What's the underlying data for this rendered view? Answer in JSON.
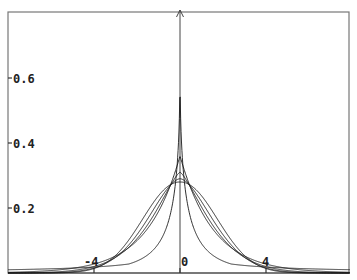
{
  "chart_data": {
    "type": "line",
    "title": "",
    "xlabel": "",
    "ylabel": "",
    "xlim": [
      -8.0,
      7.9
    ],
    "ylim": [
      0,
      0.8
    ],
    "grid": false,
    "legend": null,
    "y_ticks": [
      {
        "value": 0.2,
        "label": "0.2"
      },
      {
        "value": 0.4,
        "label": "0.4"
      },
      {
        "value": 0.6,
        "label": "0.6"
      }
    ],
    "x_ticks": [
      {
        "value": -4,
        "label": "-4"
      },
      {
        "value": 0,
        "label": "0"
      },
      {
        "value": 4,
        "label": "4"
      }
    ],
    "series": [
      {
        "name": "curve-1 (most peaked)",
        "peak": 0.63,
        "shape_p": 0.55,
        "scale": 0.3
      },
      {
        "name": "curve-2",
        "peak": 0.36,
        "shape_p": 1.0,
        "scale": 1.4
      },
      {
        "name": "curve-3",
        "peak": 0.31,
        "shape_p": 1.35,
        "scale": 1.75
      },
      {
        "name": "curve-4",
        "peak": 0.29,
        "shape_p": 1.7,
        "scale": 2.0
      },
      {
        "name": "curve-5 (broadest)",
        "peak": 0.28,
        "shape_p": 2.1,
        "scale": 2.25
      }
    ],
    "x": [
      -8,
      -6,
      -4,
      -3,
      -2,
      -1.5,
      -1,
      -0.5,
      0,
      0.5,
      1,
      1.5,
      2,
      3,
      4,
      6,
      8
    ],
    "series_values_approx": [
      {
        "name": "curve-1",
        "values": [
          0.005,
          0.009,
          0.018,
          0.027,
          0.045,
          0.06,
          0.09,
          0.17,
          0.63,
          0.17,
          0.09,
          0.06,
          0.045,
          0.027,
          0.018,
          0.009,
          0.005
        ]
      },
      {
        "name": "curve-2",
        "values": [
          0.0,
          0.005,
          0.02,
          0.044,
          0.086,
          0.123,
          0.176,
          0.25,
          0.36,
          0.25,
          0.176,
          0.123,
          0.086,
          0.044,
          0.02,
          0.005,
          0.0
        ]
      },
      {
        "name": "curve-3",
        "values": [
          0.0,
          0.002,
          0.015,
          0.045,
          0.108,
          0.15,
          0.2,
          0.26,
          0.31,
          0.26,
          0.2,
          0.15,
          0.108,
          0.045,
          0.015,
          0.002,
          0.0
        ]
      },
      {
        "name": "curve-4",
        "values": [
          0.0,
          0.001,
          0.012,
          0.045,
          0.12,
          0.165,
          0.21,
          0.255,
          0.29,
          0.255,
          0.21,
          0.165,
          0.12,
          0.045,
          0.012,
          0.001,
          0.0
        ]
      },
      {
        "name": "curve-5",
        "values": [
          0.0,
          0.0,
          0.01,
          0.045,
          0.13,
          0.175,
          0.22,
          0.258,
          0.28,
          0.258,
          0.22,
          0.175,
          0.13,
          0.045,
          0.01,
          0.0,
          0.0
        ]
      }
    ]
  },
  "colors": {
    "axis": "#444444",
    "curve": "#1a1a1a",
    "frame": "#666666"
  }
}
